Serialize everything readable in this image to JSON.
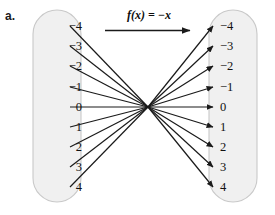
{
  "figure": {
    "part_label": "a.",
    "function_label": "f(x) = −x"
  },
  "domain_set": {
    "name": "domain-oval",
    "values": [
      "−4",
      "−3",
      "−2",
      "−1",
      "0",
      "1",
      "2",
      "3",
      "4"
    ]
  },
  "range_set": {
    "name": "range-oval",
    "values": [
      "−4",
      "−3",
      "−2",
      "−1",
      "0",
      "1",
      "2",
      "3",
      "4"
    ]
  },
  "mapping": {
    "description": "each domain value maps to its negation in the range set",
    "pairs": [
      {
        "from": "−4",
        "to": "4"
      },
      {
        "from": "−3",
        "to": "3"
      },
      {
        "from": "−2",
        "to": "2"
      },
      {
        "from": "−1",
        "to": "1"
      },
      {
        "from": "0",
        "to": "0"
      },
      {
        "from": "1",
        "to": "−1"
      },
      {
        "from": "2",
        "to": "−2"
      },
      {
        "from": "3",
        "to": "−3"
      },
      {
        "from": "4",
        "to": "−4"
      }
    ]
  },
  "colors": {
    "oval_fill": "#f0f0f0",
    "oval_stroke": "#c9c9c9",
    "arrow": "#1a1a1a",
    "text": "#111111"
  },
  "geometry": {
    "crossing_point": {
      "x": 148,
      "y": 107
    },
    "row_y": [
      26,
      46,
      66,
      87,
      107,
      127,
      147,
      167,
      187
    ],
    "domain_start_x": 70,
    "range_end_x": 213
  }
}
